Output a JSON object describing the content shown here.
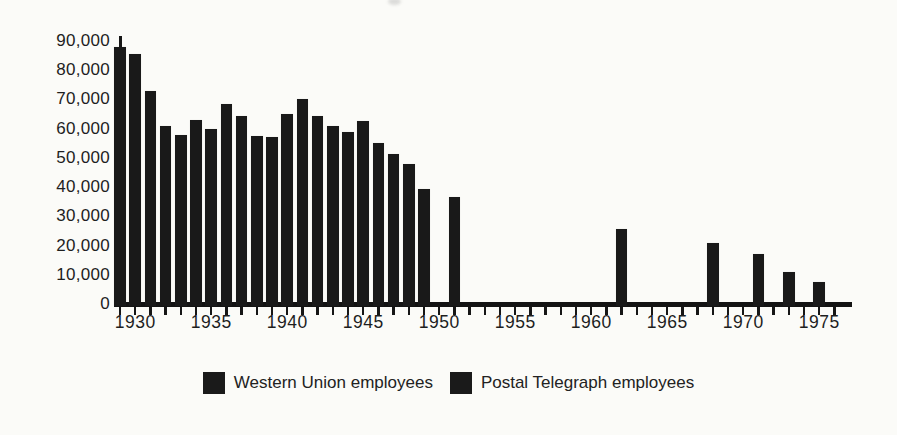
{
  "colors": {
    "ink": "#161616",
    "bar": "#191919",
    "background": "#fbfbf8"
  },
  "chart_data": {
    "type": "bar",
    "title": "",
    "xlabel": "",
    "ylabel": "",
    "grid": false,
    "ylim": [
      0,
      90000
    ],
    "y_axis": {
      "tick_interval": 10000,
      "tick_labels": [
        "90,000",
        "80,000",
        "70,000",
        "60,000",
        "50,000",
        "40,000",
        "30,000",
        "20,000",
        "10,000",
        "0"
      ],
      "tick_values": [
        90000,
        80000,
        70000,
        60000,
        50000,
        40000,
        30000,
        20000,
        10000,
        0
      ]
    },
    "x_axis": {
      "tick_start_year": 1929,
      "tick_end_year": 1976,
      "labeled_years": [
        "1930",
        "1935",
        "1940",
        "1945",
        "1950",
        "1955",
        "1960",
        "1965",
        "1970",
        "1975"
      ]
    },
    "bars": [
      {
        "year": 1929,
        "value": 88000
      },
      {
        "year": 1930,
        "value": 85500
      },
      {
        "year": 1931,
        "value": 73000
      },
      {
        "year": 1932,
        "value": 61000
      },
      {
        "year": 1933,
        "value": 58000
      },
      {
        "year": 1934,
        "value": 63000
      },
      {
        "year": 1935,
        "value": 60000
      },
      {
        "year": 1936,
        "value": 68500
      },
      {
        "year": 1937,
        "value": 64500
      },
      {
        "year": 1938,
        "value": 57500
      },
      {
        "year": 1939,
        "value": 57000
      },
      {
        "year": 1940,
        "value": 65000
      },
      {
        "year": 1941,
        "value": 70000
      },
      {
        "year": 1942,
        "value": 64500
      },
      {
        "year": 1943,
        "value": 61000
      },
      {
        "year": 1944,
        "value": 59000
      },
      {
        "year": 1945,
        "value": 62500
      },
      {
        "year": 1946,
        "value": 55000
      },
      {
        "year": 1947,
        "value": 51500
      },
      {
        "year": 1948,
        "value": 48000
      },
      {
        "year": 1949,
        "value": 39500
      },
      {
        "year": 1951,
        "value": 36500
      },
      {
        "year": 1962,
        "value": 25500
      },
      {
        "year": 1968,
        "value": 21000
      },
      {
        "year": 1971,
        "value": 17000
      },
      {
        "year": 1973,
        "value": 11000
      },
      {
        "year": 1975,
        "value": 7500
      }
    ],
    "legend_position": "bottom",
    "legend": [
      {
        "label": "Western Union employees",
        "color": "#1a1a1a"
      },
      {
        "label": "Postal Telegraph employees",
        "color": "#1a1a1a"
      }
    ]
  }
}
